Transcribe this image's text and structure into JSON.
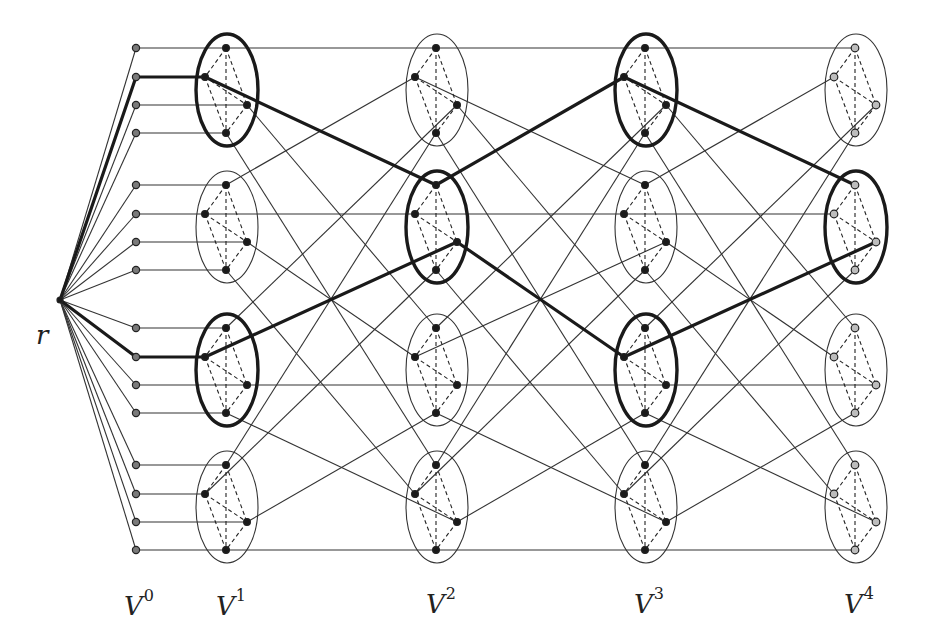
{
  "diagram": {
    "title": "",
    "root_label": "r",
    "layer_labels": [
      {
        "base": "V",
        "sup": "0"
      },
      {
        "base": "V",
        "sup": "1"
      },
      {
        "base": "V",
        "sup": "2"
      },
      {
        "base": "V",
        "sup": "3"
      },
      {
        "base": "V",
        "sup": "4"
      }
    ],
    "colors": {
      "layer0_node": "#7a7a7a",
      "inner_node": "#1a1a1a",
      "last_layer_node": "#bdbdbd",
      "edge": "#333333",
      "bold_path": "#1a1a1a"
    },
    "structure": {
      "root": {
        "x": 60,
        "y": 300
      },
      "layer0_x": 136,
      "layer_x": [
        226,
        436,
        645,
        855
      ],
      "cluster_top_y": [
        48,
        185,
        328,
        465
      ],
      "node_offsets": [
        [
          0,
          0
        ],
        [
          -21,
          29
        ],
        [
          21,
          57
        ],
        [
          0,
          85
        ]
      ],
      "clusters_per_layer": 4,
      "nodes_per_cluster": 4,
      "edge_rule": "layer k cluster i node j -> layer k+1 cluster j node i"
    },
    "bold_clusters": [
      {
        "layer": 1,
        "cluster": 0
      },
      {
        "layer": 1,
        "cluster": 2
      },
      {
        "layer": 2,
        "cluster": 1
      },
      {
        "layer": 3,
        "cluster": 0
      },
      {
        "layer": 3,
        "cluster": 2
      },
      {
        "layer": 4,
        "cluster": 1
      }
    ],
    "bold_paths": [
      {
        "v0_index": 1,
        "steps": [
          [
            1,
            0,
            1
          ],
          [
            2,
            1,
            0
          ],
          [
            3,
            0,
            1
          ],
          [
            4,
            1,
            0
          ]
        ]
      },
      {
        "v0_index": 9,
        "steps": [
          [
            1,
            2,
            1
          ],
          [
            2,
            1,
            2
          ],
          [
            3,
            2,
            1
          ],
          [
            4,
            1,
            2
          ]
        ]
      }
    ]
  }
}
